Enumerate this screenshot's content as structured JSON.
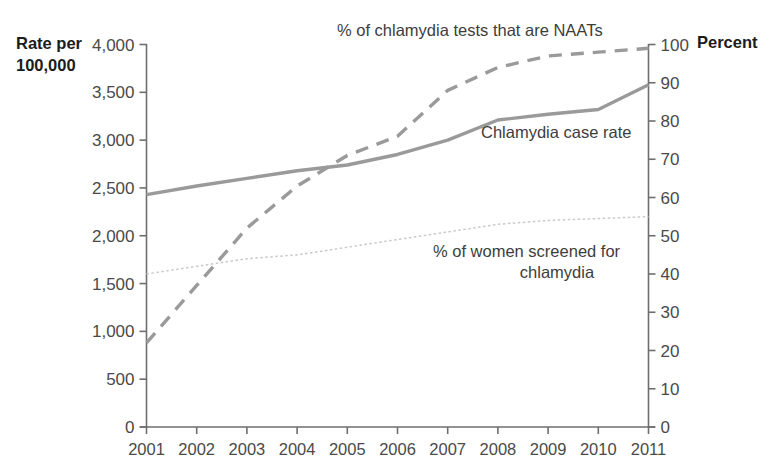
{
  "chart_data": {
    "type": "line",
    "title": "",
    "xlabel": "",
    "ylabel": "Rate per 100,000",
    "y2label": "Percent",
    "grid": false,
    "legend_position": "inline-annotations",
    "categories": [
      "2001",
      "2002",
      "2003",
      "2004",
      "2005",
      "2006",
      "2007",
      "2008",
      "2009",
      "2010",
      "2011"
    ],
    "ylim": [
      0,
      4000
    ],
    "y2lim": [
      0,
      100
    ],
    "yticks": [
      "0",
      "500",
      "1,000",
      "1,500",
      "2,000",
      "2,500",
      "3,000",
      "3,500",
      "4,000"
    ],
    "y2ticks": [
      "0",
      "10",
      "20",
      "30",
      "40",
      "50",
      "60",
      "70",
      "80",
      "90",
      "100"
    ],
    "series": [
      {
        "name": "Chlamydia case rate",
        "axis": "left",
        "style": "solid",
        "color": "#9a9a9a",
        "values": [
          2430,
          2520,
          2600,
          2680,
          2740,
          2850,
          3000,
          3210,
          3270,
          3320,
          3580
        ]
      },
      {
        "name": "% of chlamydia tests that are NAATs",
        "axis": "right",
        "style": "dashed",
        "color": "#9a9a9a",
        "values": [
          22,
          37,
          52,
          63,
          71,
          76,
          88,
          94,
          97,
          98,
          99
        ]
      },
      {
        "name": "% of women screened for chlamydia",
        "axis": "right",
        "style": "dotted",
        "color": "#c9c9c9",
        "values": [
          40,
          42,
          44,
          45,
          47,
          49,
          51,
          53,
          54,
          54.5,
          55
        ]
      }
    ],
    "annotations": [
      {
        "id": "naats-label",
        "text": "% of chlamydia tests that are NAATs",
        "x": 337,
        "y": 36,
        "anchor": "start"
      },
      {
        "id": "case-rate-label",
        "text": "Chlamydia case rate",
        "x": 481,
        "y": 138,
        "anchor": "start"
      },
      {
        "id": "screened-label-line1",
        "text": "% of women screened for",
        "x": 433,
        "y": 257,
        "anchor": "start"
      },
      {
        "id": "screened-label-line2",
        "text": "chlamydia",
        "x": 557,
        "y": 278,
        "anchor": "middle"
      }
    ]
  },
  "axes": {
    "left_title_line1": "Rate per",
    "left_title_line2": "100,000",
    "right_title": "Percent"
  },
  "colors": {
    "solid_line": "#9a9a9a",
    "dashed_line": "#9a9a9a",
    "dotted_line": "#c9c9c9",
    "axis": "#6e6e6e",
    "text": "#4a4a4a",
    "title_text": "#1c1c1c",
    "background": "#ffffff"
  }
}
